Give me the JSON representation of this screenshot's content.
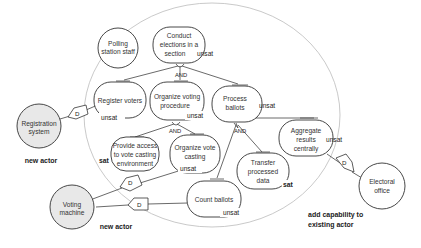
{
  "diagram": {
    "type": "i* / goal model",
    "boundary_actor": "Polling station staff",
    "actors": [
      {
        "id": "polling-station-staff",
        "label_lines": [
          "Polling",
          "station staff"
        ],
        "fill": "#ffffff"
      },
      {
        "id": "registration-system",
        "label_lines": [
          "Registration",
          "system"
        ],
        "fill": "#e8e8e8",
        "annotation": "new actor"
      },
      {
        "id": "voting-machine",
        "label_lines": [
          "Voting",
          "machine"
        ],
        "fill": "#e8e8e8",
        "annotation": "new actor"
      },
      {
        "id": "electoral-office",
        "label_lines": [
          "Electoral",
          "office"
        ],
        "fill": "#ffffff",
        "annotation_lines": [
          "add capability to",
          "existing actor"
        ]
      }
    ],
    "goals": [
      {
        "id": "conduct-elections",
        "label_lines": [
          "Conduct",
          "elections in a",
          "section"
        ],
        "status": "unsat"
      },
      {
        "id": "register-voters",
        "label_lines": [
          "Register voters"
        ],
        "status": "unsat"
      },
      {
        "id": "organize-voting-procedure",
        "label_lines": [
          "Organize voting",
          "procedure"
        ],
        "status": "unsat"
      },
      {
        "id": "process-ballots",
        "label_lines": [
          "Process",
          "ballots"
        ],
        "status": "unsat"
      },
      {
        "id": "provide-access",
        "label_lines": [
          "Provide access",
          "to vote casting",
          "environment"
        ],
        "status": "sat"
      },
      {
        "id": "organize-vote-casting",
        "label_lines": [
          "Organize vote",
          "casting"
        ],
        "status": "unsat"
      },
      {
        "id": "aggregate-results",
        "label_lines": [
          "Aggregate",
          "results",
          "centrally"
        ],
        "status": "unsat"
      },
      {
        "id": "transfer-processed-data",
        "label_lines": [
          "Transfer",
          "processed",
          "data"
        ],
        "status": "sat"
      },
      {
        "id": "count-ballots",
        "label_lines": [
          "Count ballots"
        ],
        "status": "unsat"
      }
    ],
    "decompositions": [
      {
        "parent": "conduct-elections",
        "type": "AND",
        "children": [
          "register-voters",
          "organize-voting-procedure",
          "process-ballots"
        ]
      },
      {
        "parent": "organize-voting-procedure",
        "type": "AND",
        "children": [
          "provide-access",
          "organize-vote-casting"
        ]
      },
      {
        "parent": "process-ballots",
        "type": "AND",
        "children": [
          "transfer-processed-data",
          "count-ballots"
        ]
      }
    ],
    "dependencies": [
      {
        "from": "register-voters",
        "to": "registration-system",
        "label": "D"
      },
      {
        "from": "organize-vote-casting",
        "to": "voting-machine",
        "label": "D"
      },
      {
        "from": "count-ballots",
        "to": "voting-machine",
        "label": "D"
      },
      {
        "from": "aggregate-results",
        "to": "electoral-office",
        "label": "D"
      }
    ],
    "and_label": "AND",
    "dep_label": "D"
  }
}
